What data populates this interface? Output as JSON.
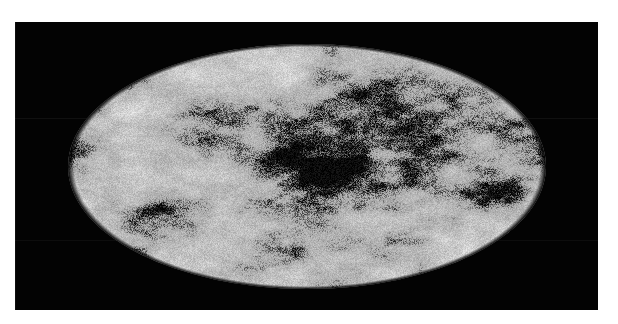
{
  "figure": {
    "kind": "all-sky-map",
    "projection": "Mollweide",
    "colormap": "grayscale",
    "title": "",
    "caption": "",
    "background_color": "#030303",
    "page_color": "#ffffff",
    "map_base_color": "#a9a9a9",
    "map_dark_color": "#0a0a0a",
    "map_light_color": "#f2f2f2"
  },
  "panel": {
    "x": 15,
    "y": 22,
    "width": 583,
    "height": 288
  },
  "ellipse": {
    "center_x": 292,
    "center_y": 144,
    "semi_major_axis": 239,
    "semi_minor_axis": 122
  },
  "chart_data": {
    "type": "heatmap",
    "title": "",
    "subtitle": "",
    "xlabel": "",
    "ylabel": "",
    "projection": "Mollweide",
    "grid": false,
    "legend": "none",
    "colorbar": "none",
    "tick_labels": [],
    "annotations": [],
    "value_range": [
      -1,
      1
    ],
    "features": [
      {
        "name": "central-dark-cluster",
        "u": 0.04,
        "v": 0.04,
        "extent": 0.3,
        "intensity": 0.95
      },
      {
        "name": "right-limb-dark-lobe",
        "u": 0.8,
        "v": 0.22,
        "extent": 0.14,
        "intensity": 0.85
      },
      {
        "name": "upper-right-band",
        "u": 0.42,
        "v": -0.42,
        "extent": 0.22,
        "intensity": 0.55
      },
      {
        "name": "lower-left-patch",
        "u": -0.62,
        "v": 0.4,
        "extent": 0.15,
        "intensity": 0.55
      },
      {
        "name": "upper-left-patch",
        "u": -0.45,
        "v": -0.42,
        "extent": 0.18,
        "intensity": 0.45
      },
      {
        "name": "lower-center-streak",
        "u": 0.1,
        "v": 0.6,
        "extent": 0.2,
        "intensity": 0.5
      }
    ],
    "noise": {
      "granularity": "fine",
      "speckle_density": 0.33,
      "seed": 20240711
    }
  }
}
